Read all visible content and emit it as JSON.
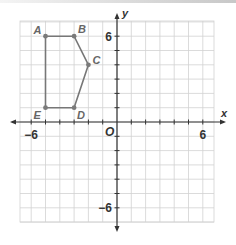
{
  "chart_data": {
    "type": "scatter",
    "title": "",
    "xlabel": "x",
    "ylabel": "y",
    "origin_label": "O",
    "xlim": [
      -7,
      7
    ],
    "ylim": [
      -7,
      7
    ],
    "grid": true,
    "x_tick_labels": [
      {
        "value": -6,
        "label": "−6"
      },
      {
        "value": 6,
        "label": "6"
      }
    ],
    "y_tick_labels": [
      {
        "value": 6,
        "label": "6"
      },
      {
        "value": -6,
        "label": "−6"
      }
    ],
    "polygon": {
      "name": "ABCDE",
      "closed": true,
      "vertices": [
        {
          "label": "A",
          "x": -5,
          "y": 6
        },
        {
          "label": "B",
          "x": -3,
          "y": 6
        },
        {
          "label": "C",
          "x": -2,
          "y": 4
        },
        {
          "label": "D",
          "x": -3,
          "y": 1
        },
        {
          "label": "E",
          "x": -5,
          "y": 1
        }
      ]
    },
    "colors": {
      "grid": "#d2d2d2",
      "axis": "#333333",
      "polygon": "#777777",
      "vertex": "#7a7a7a"
    }
  }
}
